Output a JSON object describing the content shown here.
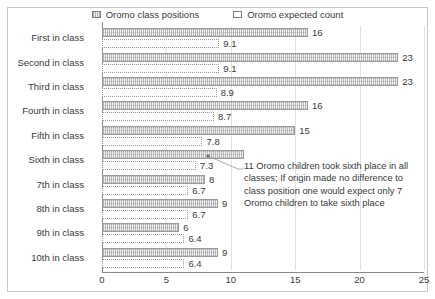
{
  "legend": {
    "entries": [
      {
        "label": "Oromo class positions",
        "key": "positions"
      },
      {
        "label": "Oromo expected count",
        "key": "expected"
      }
    ]
  },
  "annotation": {
    "text": "11 Oromo children took sixth place in all classes; If origin made no difference to class position one would expect only 7 Oromo children to take sixth place"
  },
  "chart_data": {
    "type": "bar",
    "orientation": "horizontal",
    "title": "",
    "xlabel": "",
    "ylabel": "",
    "xlim": [
      0,
      25
    ],
    "xticks": [
      0,
      5,
      10,
      15,
      20,
      25
    ],
    "grid": true,
    "legend_position": "top-center",
    "categories": [
      "First in class",
      "Second in class",
      "Third in class",
      "Fourth in class",
      "Fifth in class",
      "Sixth in class",
      "7th in class",
      "8th in class",
      "9th in class",
      "10th in class"
    ],
    "series": [
      {
        "name": "Oromo class positions",
        "values": [
          16,
          23,
          23,
          16,
          15,
          11,
          8,
          9,
          6,
          9
        ],
        "labels": [
          "16",
          "23",
          "23",
          "16",
          "15",
          "",
          "8",
          "9",
          "6",
          "9"
        ]
      },
      {
        "name": "Oromo expected count",
        "values": [
          9.1,
          9.1,
          8.9,
          8.7,
          7.8,
          7.3,
          6.7,
          6.7,
          6.4,
          6.4
        ],
        "labels": [
          "9.1",
          "9.1",
          "8.9",
          "8.7",
          "7.8",
          "7.3",
          "6.7",
          "6.7",
          "6.4",
          "6.4"
        ]
      }
    ]
  }
}
